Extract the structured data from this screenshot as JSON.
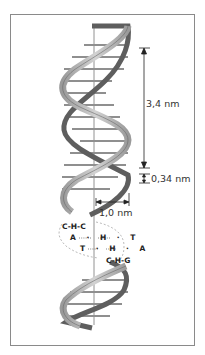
{
  "diagram": {
    "labels": {
      "pitch": "3,4 nm",
      "rise": "0,34 nm",
      "width": "1,0 nm"
    },
    "base_pairs": [
      {
        "left": "C",
        "mid": "H",
        "right": "C",
        "row": "G-H-C"
      },
      {
        "left": "A",
        "mid": "H",
        "right": "T"
      },
      {
        "left": "T",
        "mid": "H",
        "right": "A"
      },
      {
        "left": "C",
        "mid": "H",
        "right": "G"
      }
    ],
    "text_rows": [
      "C-H-C",
      "A · H · T",
      "T · H · A",
      "C-H-G"
    ],
    "colors": {
      "ribbon": "#b5b5b5",
      "ribbon_dark": "#5e5e5e",
      "frame": "#8a8a8a",
      "rung": "#8f8f8f",
      "text": "#333333"
    }
  }
}
